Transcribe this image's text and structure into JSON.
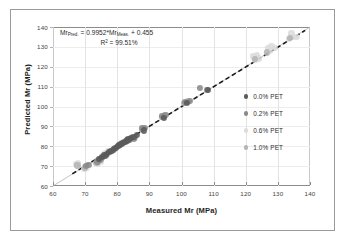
{
  "chart_data": {
    "type": "scatter",
    "title": "",
    "xlabel": "Measured Mr (MPa)",
    "ylabel": "Predicted Mr  (MPa)",
    "xlim": [
      60,
      140
    ],
    "ylim": [
      60,
      140
    ],
    "xticks": [
      60,
      70,
      80,
      90,
      100,
      110,
      120,
      130,
      140
    ],
    "yticks": [
      60,
      70,
      80,
      90,
      100,
      110,
      120,
      130,
      140
    ],
    "grid": "vertical-light",
    "legend_position": "right-middle",
    "annotations": {
      "equation_prefix": "Mr",
      "equation_sub1": "Pred.",
      "equation_mid": "= 0.9952*Mr",
      "equation_sub2": "Meas.",
      "equation_suffix": "+ 0.455",
      "r2_prefix": "R",
      "r2_sup": "2",
      "r2_value": "= 99.51%"
    },
    "reference_line": {
      "name": "1:1 line",
      "from": [
        60,
        60
      ],
      "to": [
        140,
        140
      ],
      "color": "#a9a9a9",
      "style": "solid"
    },
    "trend_line": {
      "name": "regression fit",
      "slope": 0.9952,
      "intercept": 0.455,
      "from": [
        66,
        66.13
      ],
      "to": [
        138.5,
        138.29
      ],
      "color": "#1a1a1a",
      "style": "dashed"
    },
    "series": [
      {
        "name": "0.0% PET",
        "color": "#5a5a5a",
        "marker": "circle",
        "points": [
          [
            74.2,
            73.5
          ],
          [
            75.1,
            74.6
          ],
          [
            76.0,
            75.4
          ],
          [
            76.8,
            76.2
          ],
          [
            77.5,
            77.0
          ],
          [
            78.2,
            77.8
          ],
          [
            78.9,
            78.6
          ],
          [
            79.5,
            79.3
          ],
          [
            80.1,
            80.0
          ],
          [
            80.7,
            80.6
          ],
          [
            81.2,
            81.2
          ],
          [
            81.8,
            81.8
          ],
          [
            82.3,
            82.3
          ],
          [
            82.9,
            82.9
          ],
          [
            83.5,
            83.4
          ],
          [
            84.2,
            84.0
          ],
          [
            85.0,
            84.8
          ],
          [
            86.0,
            85.6
          ],
          [
            88.3,
            88.0
          ],
          [
            94.4,
            94.1
          ],
          [
            101.8,
            102.0
          ],
          [
            108.2,
            108.4
          ]
        ]
      },
      {
        "name": "0.2% PET",
        "color": "#8a8a8a",
        "marker": "circle",
        "points": [
          [
            70.2,
            70.0
          ],
          [
            71.0,
            70.6
          ],
          [
            73.8,
            72.4
          ],
          [
            74.5,
            73.2
          ],
          [
            75.3,
            74.0
          ],
          [
            76.5,
            75.6
          ],
          [
            77.8,
            77.2
          ],
          [
            78.6,
            78.2
          ],
          [
            79.2,
            79.0
          ],
          [
            80.0,
            79.8
          ],
          [
            80.8,
            80.5
          ],
          [
            81.5,
            81.4
          ],
          [
            82.0,
            82.0
          ],
          [
            83.0,
            82.8
          ],
          [
            84.0,
            83.6
          ],
          [
            85.2,
            83.9
          ],
          [
            87.8,
            89.0
          ],
          [
            88.5,
            89.4
          ],
          [
            94.0,
            95.2
          ],
          [
            95.0,
            95.6
          ],
          [
            101.0,
            102.4
          ],
          [
            102.5,
            103.0
          ],
          [
            105.8,
            109.5
          ],
          [
            108.0,
            108.2
          ]
        ]
      },
      {
        "name": "0.6% PET",
        "color": "#dcdcdc",
        "marker": "circle",
        "points": [
          [
            67.2,
            71.0
          ],
          [
            67.8,
            71.4
          ],
          [
            69.8,
            68.6
          ],
          [
            70.5,
            69.2
          ],
          [
            74.0,
            71.4
          ],
          [
            74.8,
            72.0
          ],
          [
            76.2,
            76.8
          ],
          [
            77.0,
            77.4
          ],
          [
            122.4,
            125.2
          ],
          [
            123.0,
            123.3
          ],
          [
            123.5,
            126.0
          ],
          [
            124.0,
            124.2
          ],
          [
            126.8,
            129.6
          ],
          [
            127.5,
            127.9
          ],
          [
            128.0,
            130.5
          ],
          [
            129.2,
            129.4
          ],
          [
            133.5,
            134.2
          ],
          [
            134.2,
            136.8
          ],
          [
            135.0,
            135.2
          ],
          [
            136.0,
            135.0
          ]
        ]
      },
      {
        "name": "1.0% PET",
        "color": "#b4b4b4",
        "marker": "circle",
        "points": [
          [
            67.6,
            70.4
          ],
          [
            70.0,
            69.4
          ],
          [
            73.5,
            71.8
          ],
          [
            75.0,
            73.0
          ],
          [
            76.4,
            75.2
          ],
          [
            78.0,
            77.6
          ],
          [
            79.0,
            78.4
          ],
          [
            80.4,
            80.2
          ],
          [
            81.0,
            81.0
          ],
          [
            82.6,
            82.4
          ],
          [
            83.8,
            83.2
          ],
          [
            85.5,
            84.4
          ],
          [
            88.0,
            89.2
          ],
          [
            93.8,
            94.8
          ],
          [
            94.6,
            95.0
          ],
          [
            100.8,
            101.8
          ],
          [
            102.0,
            102.6
          ],
          [
            122.8,
            124.0
          ],
          [
            126.5,
            127.2
          ],
          [
            133.8,
            134.6
          ]
        ]
      }
    ]
  },
  "legend": {
    "items": [
      {
        "label": "0.0% PET",
        "color": "#5a5a5a"
      },
      {
        "label": "0.2% PET",
        "color": "#8a8a8a"
      },
      {
        "label": "0.6% PET",
        "color": "#dcdcdc"
      },
      {
        "label": "1.0% PET",
        "color": "#b4b4b4"
      }
    ]
  }
}
